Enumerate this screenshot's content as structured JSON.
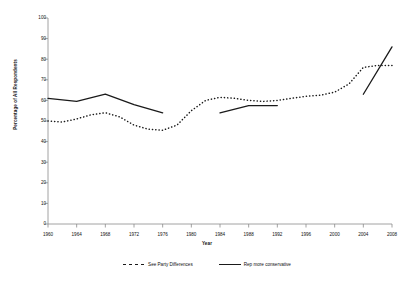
{
  "chart_data": {
    "type": "line",
    "title": "",
    "xlabel": "Year",
    "ylabel": "Percentage of All Respondents",
    "xlim": [
      1960,
      2008
    ],
    "ylim": [
      0,
      100
    ],
    "grid": false,
    "legend_position": "bottom",
    "x_ticks": [
      1960,
      1964,
      1968,
      1972,
      1976,
      1980,
      1984,
      1988,
      1992,
      1996,
      2000,
      2004,
      2008
    ],
    "y_ticks": [
      0,
      10,
      20,
      30,
      40,
      50,
      60,
      70,
      80,
      90,
      100
    ],
    "series": [
      {
        "name": "See Party Differences",
        "style": "dashed",
        "color": "#1a1a1a",
        "x": [
          1960,
          1962,
          1964,
          1966,
          1968,
          1970,
          1972,
          1974,
          1976,
          1978,
          1980,
          1982,
          1984,
          1986,
          1988,
          1990,
          1992,
          1994,
          1996,
          1998,
          2000,
          2002,
          2004,
          2006,
          2008
        ],
        "values": [
          50,
          49.5,
          51,
          53,
          54,
          52,
          48,
          46,
          45.5,
          48,
          55,
          60,
          61.5,
          61,
          60,
          59.5,
          60,
          61,
          62,
          62.5,
          64,
          68,
          76,
          77,
          77
        ]
      },
      {
        "name": "Rep more conservative",
        "style": "solid",
        "color": "#1a1a1a",
        "segments": [
          {
            "x": [
              1960,
              1964,
              1968,
              1972,
              1976
            ],
            "values": [
              61,
              59.5,
              63,
              58,
              54
            ]
          },
          {
            "x": [
              1984,
              1988,
              1992
            ],
            "values": [
              54,
              57.5,
              57.5
            ]
          },
          {
            "x": [
              2004,
              2008
            ],
            "values": [
              63,
              86
            ]
          }
        ]
      }
    ]
  },
  "legend": {
    "items": [
      {
        "label": "See Party Differences",
        "style": "dashed"
      },
      {
        "label": "Rep more conservative",
        "style": "solid"
      }
    ]
  }
}
